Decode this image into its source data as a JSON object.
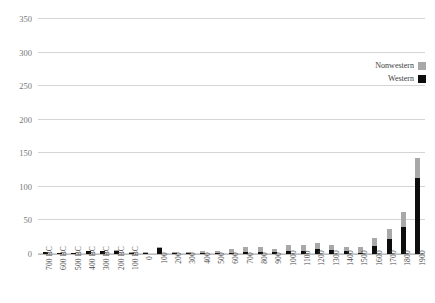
{
  "chart_data": {
    "type": "bar",
    "title": "",
    "xlabel": "",
    "ylabel": "",
    "ylim": [
      0,
      350
    ],
    "yticks": [
      0,
      50,
      100,
      150,
      200,
      250,
      300,
      350
    ],
    "grid": true,
    "stacked": true,
    "legend_position": "top-right",
    "categories": [
      "700 BC",
      "600 BC",
      "500 BC",
      "400 BC",
      "300 BC",
      "200 BC",
      "100 BC",
      "0",
      "100",
      "200",
      "300",
      "400",
      "500",
      "600",
      "700",
      "800",
      "900",
      "1000",
      "1100",
      "1200",
      "1300",
      "1400",
      "1500",
      "1600",
      "1700",
      "1800",
      "1900"
    ],
    "series": [
      {
        "name": "Western",
        "color": "#0d0d0d",
        "values": [
          3,
          2,
          1,
          5,
          5,
          4,
          1,
          2,
          9,
          2,
          1,
          2,
          1,
          2,
          3,
          3,
          3,
          5,
          5,
          7,
          6,
          4,
          1,
          12,
          22,
          40,
          113
        ]
      },
      {
        "name": "Nonwestern",
        "color": "#a8a8a8",
        "values": [
          0,
          0,
          0,
          0,
          0,
          1,
          1,
          1,
          2,
          1,
          1,
          2,
          3,
          6,
          7,
          7,
          5,
          8,
          9,
          10,
          7,
          6,
          9,
          12,
          16,
          23,
          30
        ]
      }
    ],
    "totals": [
      3,
      2,
      1,
      5,
      5,
      5,
      2,
      3,
      11,
      3,
      2,
      4,
      4,
      8,
      10,
      10,
      8,
      13,
      14,
      17,
      13,
      10,
      10,
      24,
      38,
      63,
      143
    ]
  },
  "legend": {
    "items": [
      {
        "label": "Nonwestern",
        "color": "#a8a8a8"
      },
      {
        "label": "Western",
        "color": "#0d0d0d"
      }
    ]
  }
}
